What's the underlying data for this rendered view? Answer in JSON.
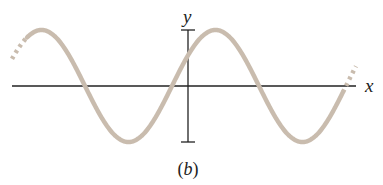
{
  "figure": {
    "caption": "(b)",
    "x_axis_label": "x",
    "y_axis_label": "y",
    "wave_color": "#c9bcae",
    "axis_color": "#222222"
  },
  "chart_data": {
    "type": "line",
    "title": "",
    "subtitle": "(b)",
    "xlabel": "x",
    "ylabel": "y",
    "function": "y = A sin(k x + phi)",
    "amplitude_px": 56,
    "wavelength_px": 174,
    "crests_px": [
      [
        40,
        30
      ],
      [
        215,
        29
      ]
    ],
    "troughs_px": [
      [
        128,
        141
      ],
      [
        302,
        141
      ]
    ],
    "zero_crossings_px": [
      85,
      172,
      258,
      345
    ],
    "grid": false,
    "legend": null
  }
}
